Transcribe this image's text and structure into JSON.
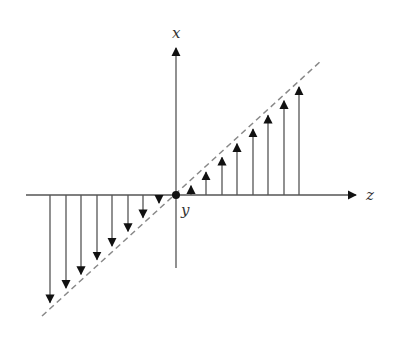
{
  "diagram": {
    "title": "",
    "labels": {
      "x_axis": "x",
      "z_axis": "z",
      "origin": "y"
    },
    "origin": [
      176,
      195
    ],
    "z_axis": {
      "from": [
        26,
        195
      ],
      "to": [
        356,
        195
      ]
    },
    "x_axis": {
      "from": [
        176,
        268
      ],
      "to": [
        176,
        48
      ]
    },
    "dashed_line": {
      "from": [
        42,
        316
      ],
      "to": [
        322,
        60
      ]
    },
    "arrows_positive_z": [
      191,
      206,
      222,
      237,
      253,
      268,
      284,
      299
    ],
    "arrows_negative_z": [
      50,
      66,
      81,
      97,
      112,
      128,
      143,
      159
    ],
    "colors": {
      "line": "#555555",
      "dash": "#888888",
      "arrowhead": "#111111"
    }
  }
}
